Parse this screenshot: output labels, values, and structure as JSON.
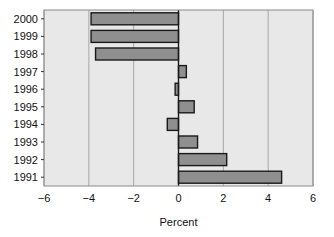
{
  "chart_data": {
    "type": "bar",
    "orientation": "horizontal",
    "title": "",
    "xlabel": "Percent",
    "ylabel": "",
    "categories": [
      "2000",
      "1999",
      "1998",
      "1997",
      "1996",
      "1995",
      "1994",
      "1993",
      "1992",
      "1991"
    ],
    "values": [
      -3.9,
      -3.9,
      -3.7,
      0.35,
      -0.15,
      0.7,
      -0.5,
      0.85,
      2.15,
      4.6
    ],
    "xlim": [
      -6,
      6
    ],
    "xticks": [
      -6,
      -4,
      -2,
      0,
      2,
      4,
      6
    ],
    "xtick_labels": [
      "−6",
      "−4",
      "−2",
      "0",
      "2",
      "4",
      "6"
    ],
    "grid": "vertical",
    "legend": "none",
    "bar_fill": "#8f8f8f",
    "bar_stroke": "#1a1a1a",
    "plot_background": "#e8e8e8",
    "grid_color": "#a8a8a8",
    "zero_line_color": "#1a1a1a",
    "frame_color": "#8a8a8a"
  },
  "axis": {
    "x_title": "Percent"
  }
}
